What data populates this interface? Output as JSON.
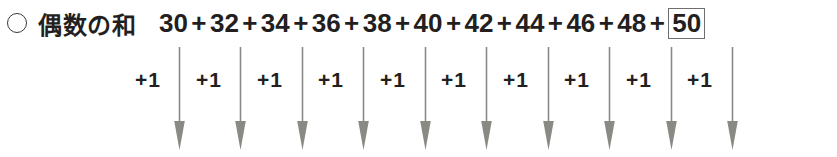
{
  "label": {
    "bullet_icon": "open-circle-icon",
    "text": "偶数の和"
  },
  "expression": {
    "terms": [
      "30",
      "32",
      "34",
      "36",
      "38",
      "40",
      "42",
      "44",
      "46",
      "48"
    ],
    "operator": "+",
    "answer": "50",
    "answer_is_boxed": true,
    "full_text": "30+32+34+36+38+40+42+44+46+48+50"
  },
  "annotations": {
    "label_text": "+1",
    "count": 10,
    "labels": [
      "+1",
      "+1",
      "+1",
      "+1",
      "+1",
      "+1",
      "+1",
      "+1",
      "+1",
      "+1"
    ],
    "arrow_icon": "arrow-down-icon",
    "arrow_count": 10
  },
  "colors": {
    "text": "#231f20",
    "arrow": "#8a8a85",
    "box_border": "#6e6e6e",
    "background": "#ffffff"
  }
}
